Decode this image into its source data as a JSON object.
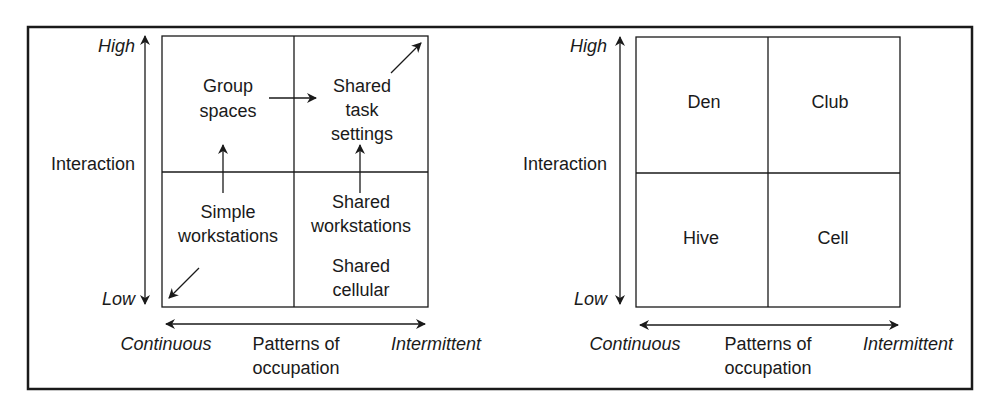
{
  "left_diagram": {
    "y_axis": {
      "high": "High",
      "low": "Low",
      "label": "Interaction"
    },
    "x_axis": {
      "left": "Continuous",
      "right": "Intermittent",
      "label_line1": "Patterns of",
      "label_line2": "occupation"
    },
    "quadrants": {
      "top_left": {
        "line1": "Group",
        "line2": "spaces"
      },
      "top_right": {
        "line1": "Shared",
        "line2": "task",
        "line3": "settings"
      },
      "bottom_left": {
        "line1": "Simple",
        "line2": "workstations"
      },
      "bottom_right": {
        "line1": "Shared",
        "line2": "workstations",
        "line3": "Shared",
        "line4": "cellular"
      }
    }
  },
  "right_diagram": {
    "y_axis": {
      "high": "High",
      "low": "Low",
      "label": "Interaction"
    },
    "x_axis": {
      "left": "Continuous",
      "right": "Intermittent",
      "label_line1": "Patterns of",
      "label_line2": "occupation"
    },
    "quadrants": {
      "top_left": "Den",
      "top_right": "Club",
      "bottom_left": "Hive",
      "bottom_right": "Cell"
    }
  },
  "colors": {
    "line": "#1a1a1a",
    "background": "#ffffff"
  }
}
